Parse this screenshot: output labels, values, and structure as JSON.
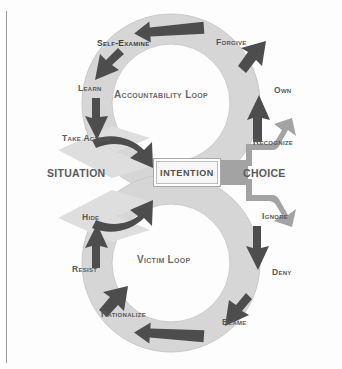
{
  "diagram": {
    "center": {
      "label": "INTENTION"
    },
    "gateways": [
      {
        "id": "situation",
        "label": "SITUATION"
      },
      {
        "id": "choice",
        "label": "CHOICE"
      }
    ],
    "loops": [
      {
        "id": "accountability-loop",
        "label": "Accountability Loop",
        "direction": "counter-clockwise",
        "steps": [
          {
            "label": "Recognize"
          },
          {
            "label": "Own"
          },
          {
            "label": "Forgive"
          },
          {
            "label": "Self-Examine"
          },
          {
            "label": "Learn"
          },
          {
            "label": "Take Action"
          }
        ]
      },
      {
        "id": "victim-loop",
        "label": "Victim Loop",
        "direction": "clockwise",
        "steps": [
          {
            "label": "Ignore"
          },
          {
            "label": "Deny"
          },
          {
            "label": "Blame"
          },
          {
            "label": "Rationalize"
          },
          {
            "label": "Resist"
          },
          {
            "label": "Hide"
          }
        ]
      }
    ],
    "colors": {
      "ring": "#d6d6d6",
      "ring_edge": "#c4c4c4",
      "arrow_dark": "#4d4d4d",
      "arrow_mid": "#9a9a9a",
      "arrow_pale": "#d9d9d9",
      "text": "#595959",
      "background": "#fdfdfd",
      "rule": "#9a9a9a"
    }
  }
}
